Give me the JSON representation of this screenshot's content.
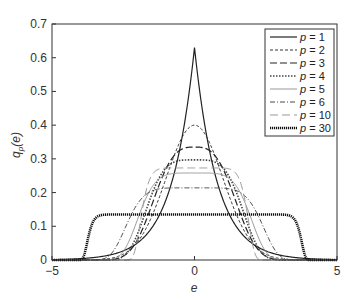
{
  "chart_data": {
    "type": "line",
    "title": "",
    "xlabel": "e",
    "ylabel": "q_p(e)",
    "xlim": [
      -5,
      5
    ],
    "ylim": [
      0,
      0.7
    ],
    "xticks": [
      -5,
      0,
      5
    ],
    "xtick_labels": [
      "−5",
      "0",
      "5"
    ],
    "yticks": [
      0,
      0.1,
      0.2,
      0.3,
      0.4,
      0.5,
      0.6,
      0.7
    ],
    "ytick_labels": [
      "0",
      "0.1",
      "0.2",
      "0.3",
      "0.4",
      "0.5",
      "0.6",
      "0.7"
    ],
    "grid": false,
    "legend_position": "upper right",
    "model": "generalized Gaussian: q(e) = peak * exp(-(|e|/alpha)^p)",
    "series": [
      {
        "name": "p = 1",
        "p": 1,
        "peak": 0.63,
        "alpha": 0.794,
        "color": "#222222",
        "width": 1.2,
        "dash": ""
      },
      {
        "name": "p = 2",
        "p": 2,
        "peak": 0.4,
        "alpha": 1.41,
        "color": "#333333",
        "width": 1.0,
        "dash": "3,2"
      },
      {
        "name": "p = 3",
        "p": 3,
        "peak": 0.335,
        "alpha": 1.672,
        "color": "#222222",
        "width": 1.2,
        "dash": "7,3"
      },
      {
        "name": "p = 4",
        "p": 4,
        "peak": 0.297,
        "alpha": 1.857,
        "color": "#444444",
        "width": 1.6,
        "dash": "1.5,1.5"
      },
      {
        "name": "p = 5",
        "p": 5,
        "peak": 0.258,
        "alpha": 2.111,
        "color": "#999999",
        "width": 1.0,
        "dash": ""
      },
      {
        "name": "p = 6",
        "p": 6,
        "peak": 0.214,
        "alpha": 2.519,
        "color": "#333333",
        "width": 0.9,
        "dash": "5,2,1,2"
      },
      {
        "name": "p = 10",
        "p": 10,
        "peak": 0.273,
        "alpha": 1.925,
        "color": "#999999",
        "width": 1.0,
        "dash": "8,4"
      },
      {
        "name": "p = 30",
        "p": 30,
        "peak": 0.135,
        "alpha": 3.772,
        "color": "#111111",
        "width": 2.6,
        "dash": "1.2,0.8"
      }
    ],
    "sample_points": {
      "x": [
        -4,
        -3,
        -2,
        -1,
        0,
        1,
        2,
        3,
        4
      ],
      "p = 1": [
        0.0041,
        0.0143,
        0.0506,
        0.178,
        0.63,
        0.178,
        0.0506,
        0.0143,
        0.0041
      ],
      "p = 2": [
        0.0001,
        0.0043,
        0.0535,
        0.242,
        0.4,
        0.242,
        0.0535,
        0.0043,
        0.0001
      ],
      "p = 3": [
        0.0,
        0.0008,
        0.0623,
        0.27,
        0.335,
        0.27,
        0.0623,
        0.0008,
        0.0
      ],
      "p = 4": [
        0.0,
        0.0002,
        0.0788,
        0.273,
        0.297,
        0.273,
        0.0788,
        0.0002,
        0.0
      ],
      "p = 5": [
        0.0,
        0.0002,
        0.1147,
        0.253,
        0.258,
        0.253,
        0.1147,
        0.0002,
        0.0
      ],
      "p = 6": [
        0.0,
        0.0062,
        0.1659,
        0.214,
        0.214,
        0.214,
        0.1659,
        0.0062,
        0.0
      ],
      "p = 10": [
        0.0,
        0.0,
        0.1435,
        0.273,
        0.273,
        0.273,
        0.1435,
        0.0,
        0.0
      ],
      "p = 30": [
        0.0,
        0.135,
        0.135,
        0.135,
        0.135,
        0.135,
        0.135,
        0.135,
        0.0
      ]
    }
  },
  "axes": {
    "xlabel": "e",
    "ylabel_main": "q",
    "ylabel_sub": "p",
    "ylabel_arg": "(e)"
  },
  "legend": {
    "items": [
      "p = 1",
      "p = 2",
      "p = 3",
      "p = 4",
      "p = 5",
      "p = 6",
      "p = 10",
      "p = 30"
    ]
  }
}
